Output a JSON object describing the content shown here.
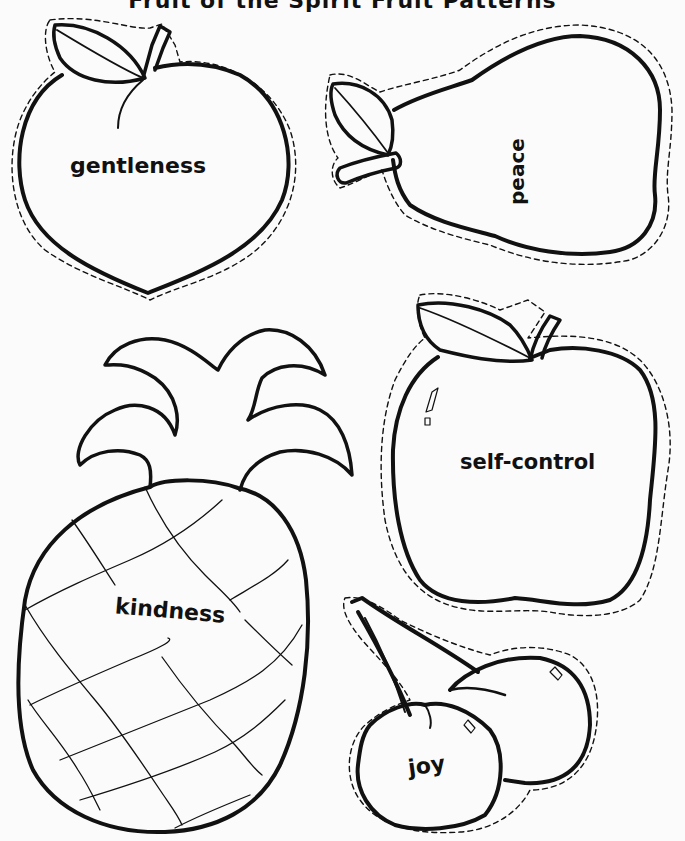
{
  "page": {
    "title": "Fruit of the Spirit Fruit Patterns",
    "ink_color": "#111111",
    "paper_color": "#fbfbfb"
  },
  "fruits": [
    {
      "id": "peach",
      "shape": "peach",
      "label": "gentleness",
      "cut_line": "dashed"
    },
    {
      "id": "pear",
      "shape": "pear",
      "label": "peace",
      "label_orientation": "vertical",
      "cut_line": "dashed"
    },
    {
      "id": "pineapple",
      "shape": "pineapple",
      "label": "kindness",
      "cut_line": "none"
    },
    {
      "id": "apple",
      "shape": "apple",
      "label": "self-control",
      "cut_line": "dashed"
    },
    {
      "id": "cherries",
      "shape": "cherries",
      "label": "joy",
      "cut_line": "dashed"
    }
  ]
}
